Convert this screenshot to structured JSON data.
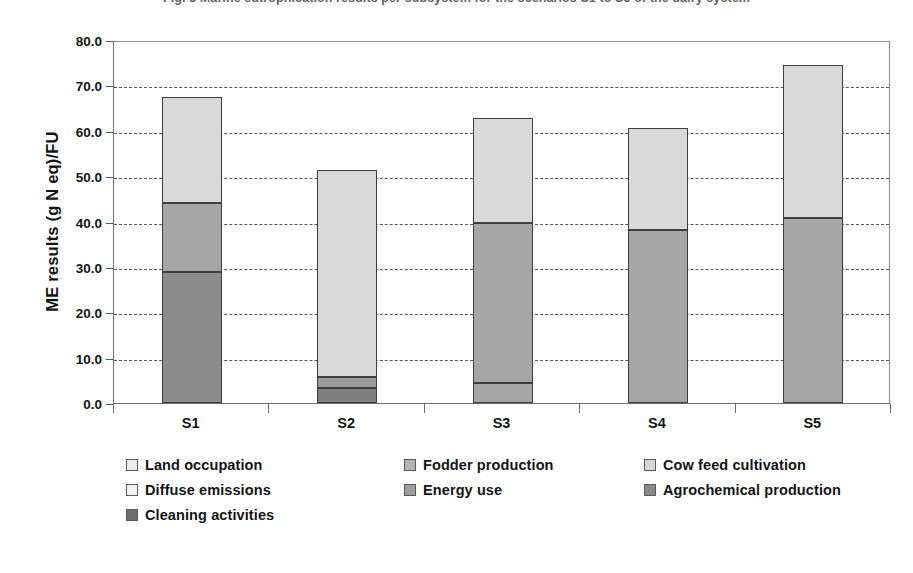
{
  "caption": "Fig. 5  Marine eutrophication results per subsystem for the scenarios S1 to S5 of the dairy system",
  "chart_data": {
    "type": "bar",
    "subtype": "stacked-bar",
    "title": "",
    "xlabel": "",
    "ylabel": "ME results (g N eq)/FU",
    "ylim": [
      0,
      80
    ],
    "ytick_labels": [
      "80.0",
      "70.0",
      "60.0",
      "50.0",
      "40.0",
      "30.0",
      "20.0",
      "10.0",
      "0.0"
    ],
    "ytick_values": [
      80,
      70,
      60,
      50,
      40,
      30,
      20,
      10,
      0
    ],
    "ystep": 10,
    "grid": "horizontal-dashed",
    "legend_position": "bottom",
    "categories": [
      "S1",
      "S2",
      "S3",
      "S4",
      "S5"
    ],
    "series": [
      {
        "name": "Land occupation",
        "color": "#d9d9d9",
        "values": [
          23.4,
          45.5,
          23.1,
          22.3,
          33.7
        ]
      },
      {
        "name": "Fodder production",
        "color": "#a6a6a6",
        "values": [
          15.2,
          0.0,
          0.0,
          0.0,
          0.0
        ]
      },
      {
        "name": "Cow feed cultivation",
        "color": "#bfbfbf",
        "values": [
          0.0,
          0.0,
          0.0,
          0.0,
          0.0
        ]
      },
      {
        "name": "Diffuse emissions",
        "color": "#ededed",
        "values": [
          0.0,
          0.0,
          0.0,
          0.0,
          0.0
        ]
      },
      {
        "name": "Energy use",
        "color": "#999999",
        "values": [
          0.0,
          2.4,
          35.4,
          38.2,
          40.8
        ]
      },
      {
        "name": "Agrochemical production",
        "color": "#8c8c8c",
        "values": [
          28.9,
          0.0,
          0.0,
          0.0,
          0.0
        ]
      },
      {
        "name": "Cleaning activities",
        "color": "#7f7f7f",
        "values": [
          0.0,
          3.4,
          4.3,
          0.0,
          0.0
        ]
      }
    ],
    "totals": [
      67.5,
      51.3,
      62.8,
      60.5,
      74.5
    ],
    "bars": [
      {
        "category": "S1",
        "total": 67.5,
        "segments": [
          {
            "label": "Agrochemical production",
            "from": 0.0,
            "to": 28.9,
            "value": 28.9,
            "color": "#8c8c8c"
          },
          {
            "label": "Fodder production",
            "from": 28.9,
            "to": 44.1,
            "value": 15.2,
            "color": "#a6a6a6"
          },
          {
            "label": "Land occupation",
            "from": 44.1,
            "to": 67.5,
            "value": 23.4,
            "color": "#d9d9d9"
          }
        ]
      },
      {
        "category": "S2",
        "total": 51.3,
        "segments": [
          {
            "label": "Cleaning activities",
            "from": 0.0,
            "to": 3.4,
            "value": 3.4,
            "color": "#7f7f7f"
          },
          {
            "label": "Energy use",
            "from": 3.4,
            "to": 5.8,
            "value": 2.4,
            "color": "#999999"
          },
          {
            "label": "Land occupation",
            "from": 5.8,
            "to": 51.3,
            "value": 45.5,
            "color": "#d9d9d9"
          }
        ]
      },
      {
        "category": "S3",
        "total": 62.8,
        "segments": [
          {
            "label": "Cleaning activities",
            "from": 0.0,
            "to": 4.3,
            "value": 4.3,
            "color": "#a6a6a6"
          },
          {
            "label": "Energy use",
            "from": 4.3,
            "to": 39.7,
            "value": 35.4,
            "color": "#a6a6a6"
          },
          {
            "label": "Land occupation",
            "from": 39.7,
            "to": 62.8,
            "value": 23.1,
            "color": "#d9d9d9"
          }
        ]
      },
      {
        "category": "S4",
        "total": 60.5,
        "segments": [
          {
            "label": "Energy use",
            "from": 0.0,
            "to": 38.2,
            "value": 38.2,
            "color": "#a6a6a6"
          },
          {
            "label": "Land occupation",
            "from": 38.2,
            "to": 60.5,
            "value": 22.3,
            "color": "#d9d9d9"
          }
        ]
      },
      {
        "category": "S5",
        "total": 74.5,
        "segments": [
          {
            "label": "Energy use",
            "from": 0.0,
            "to": 40.8,
            "value": 40.8,
            "color": "#a6a6a6"
          },
          {
            "label": "Land occupation",
            "from": 40.8,
            "to": 74.5,
            "value": 33.7,
            "color": "#d9d9d9"
          }
        ]
      }
    ],
    "legend": [
      {
        "label": "Land occupation",
        "color": "#ededed"
      },
      {
        "label": "Fodder production",
        "color": "#b3b3b3"
      },
      {
        "label": "Cow feed cultivation",
        "color": "#d4d4d4"
      },
      {
        "label": "Diffuse emissions",
        "color": "#f2f2f2"
      },
      {
        "label": "Energy use",
        "color": "#9e9e9e"
      },
      {
        "label": "Agrochemical production",
        "color": "#8a8a8a"
      },
      {
        "label": "Cleaning activities",
        "color": "#6e6e6e"
      }
    ]
  }
}
